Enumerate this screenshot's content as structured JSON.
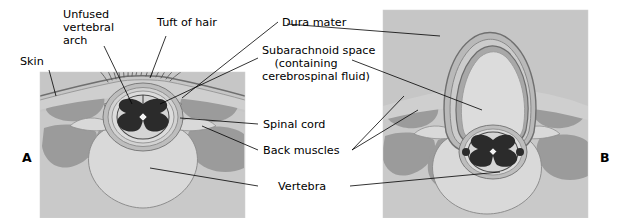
{
  "figure": {
    "title_visible": false,
    "type": "medical-cross-section-diagram"
  },
  "panels": [
    {
      "id": "A",
      "label": "A"
    },
    {
      "id": "B",
      "label": "B"
    }
  ],
  "labels": {
    "skin": "Skin",
    "unfused_vertebral_arch": "Unfused\nvertebral\narch",
    "tuft_of_hair": "Tuft of hair",
    "dura_mater": "Dura mater",
    "subarachnoid_space": "Subarachnoid space\n(containing\ncerebrospinal fluid)",
    "spinal_cord": "Spinal cord",
    "back_muscles": "Back muscles",
    "vertebra": "Vertebra"
  },
  "colors": {
    "skin_outer": "#b9b9b9",
    "skin_inner": "#cfcfcf",
    "subcutaneous": "#c6c6c6",
    "muscle": "#9b9b9b",
    "fascia": "#c9c9c9",
    "vertebra_bone": "#d9d9d9",
    "bone_edge": "#8e8e8e",
    "dura": "#8a8a8a",
    "csf": "#dcdcdc",
    "cord_white_matter": "#d5d5d5",
    "cord_gray_matter": "#2b2b2b",
    "leader_line": "#000000",
    "text": "#000000",
    "background": "#ffffff"
  }
}
